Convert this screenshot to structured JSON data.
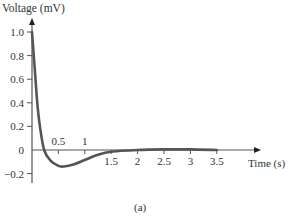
{
  "chart_data": {
    "type": "line",
    "title": "",
    "caption": "(a)",
    "xlabel": "Time (s)",
    "ylabel": "Voltage (mV)",
    "xlim": [
      0,
      3.5
    ],
    "ylim": [
      -0.2,
      1.0
    ],
    "grid": false,
    "x_ticks": [
      {
        "value": 0.5,
        "label": "0.5",
        "side": "above"
      },
      {
        "value": 1,
        "label": "1",
        "side": "above"
      },
      {
        "value": 1.5,
        "label": "1.5",
        "side": "below"
      },
      {
        "value": 2,
        "label": "2",
        "side": "below"
      },
      {
        "value": 2.5,
        "label": "2.5",
        "side": "below"
      },
      {
        "value": 3,
        "label": "3",
        "side": "below"
      },
      {
        "value": 3.5,
        "label": "3.5",
        "side": "below"
      }
    ],
    "y_ticks": [
      {
        "value": 1.0,
        "label": "1.0"
      },
      {
        "value": 0.8,
        "label": "0.8"
      },
      {
        "value": 0.6,
        "label": "0.6"
      },
      {
        "value": 0.4,
        "label": "0.4"
      },
      {
        "value": 0.2,
        "label": "0.2"
      },
      {
        "value": 0,
        "label": "0"
      },
      {
        "value": -0.2,
        "label": "−0.2"
      }
    ],
    "series": [
      {
        "name": "Voltage",
        "color": "#555555",
        "x": [
          0,
          0.05,
          0.1,
          0.15,
          0.23,
          0.35,
          0.5,
          0.6,
          0.8,
          1.0,
          1.25,
          1.5,
          2.0,
          2.5,
          3.0,
          3.5
        ],
        "y": [
          1.0,
          0.7,
          0.4,
          0.2,
          0.0,
          -0.09,
          -0.135,
          -0.14,
          -0.12,
          -0.085,
          -0.04,
          -0.015,
          0.0,
          0.005,
          0.005,
          0.0
        ]
      }
    ]
  }
}
